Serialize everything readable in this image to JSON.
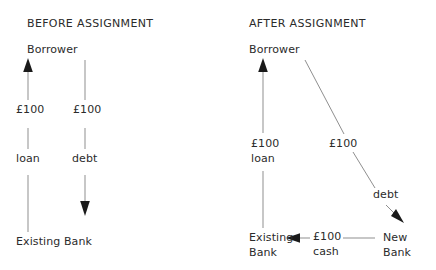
{
  "diagram": {
    "type": "flow-diagram",
    "colors": {
      "text": "#2b2b2b",
      "line": "#8f8f8f",
      "arrowhead": "#1a1a1a",
      "background": "#ffffff"
    },
    "panels": [
      {
        "id": "before",
        "title": "BEFORE ASSIGNMENT",
        "nodes": {
          "borrower": "Borrower",
          "existing_bank": "Existing Bank"
        },
        "edges": [
          {
            "id": "loan-edge",
            "amount": "£100",
            "label": "loan",
            "from": "Existing Bank",
            "to": "Borrower",
            "direction": "up"
          },
          {
            "id": "debt-edge",
            "amount": "£100",
            "label": "debt",
            "from": "Borrower",
            "to": "Existing Bank",
            "direction": "down"
          }
        ]
      },
      {
        "id": "after",
        "title": "AFTER ASSIGNMENT",
        "nodes": {
          "borrower": "Borrower",
          "existing_bank_line1": "Existing",
          "existing_bank_line2": "Bank",
          "new_bank_line1": "New",
          "new_bank_line2": "Bank"
        },
        "edges": [
          {
            "id": "loan-edge",
            "amount": "£100",
            "label": "loan",
            "from": "Existing Bank",
            "to": "Borrower",
            "direction": "up"
          },
          {
            "id": "debt-edge",
            "amount": "£100",
            "label": "debt",
            "from": "Borrower",
            "to": "New Bank",
            "direction": "diagonal-down-right"
          },
          {
            "id": "cash-edge",
            "amount": "£100",
            "label": "cash",
            "from": "New Bank",
            "to": "Existing Bank",
            "direction": "left"
          }
        ]
      }
    ]
  }
}
